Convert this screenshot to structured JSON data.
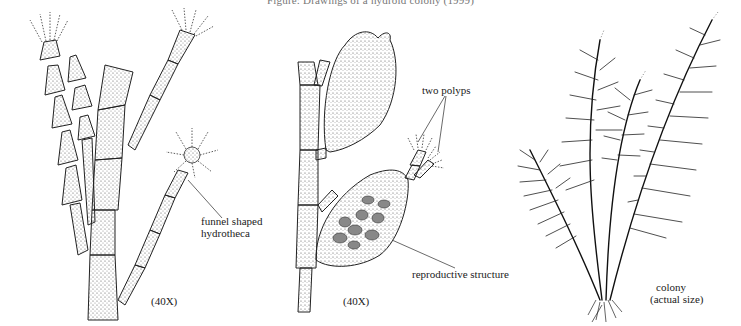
{
  "figure": {
    "caption": "Figure: Drawings of a hydroid colony (1999)",
    "panels": [
      {
        "id": "polyp-detail",
        "magnification": "(40X)",
        "labels": [
          "funnel shaped",
          "hydrotheca"
        ]
      },
      {
        "id": "reproductive-detail",
        "magnification": "(40X)",
        "labels": [
          "two polyps",
          "reproductive structure"
        ]
      },
      {
        "id": "colony",
        "labels": [
          "colony",
          "(actual size)"
        ]
      }
    ]
  },
  "colors": {
    "ink": "#222222",
    "stipple": "#555555",
    "background": "#ffffff"
  }
}
